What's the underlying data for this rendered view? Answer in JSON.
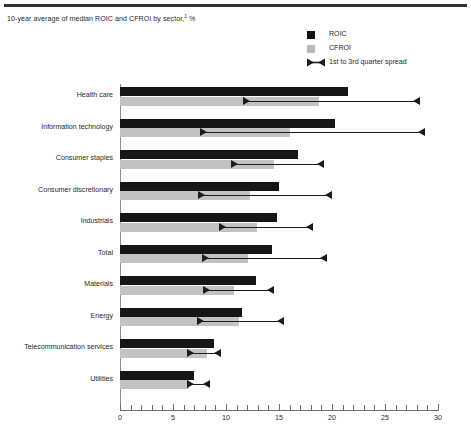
{
  "chart_title": "10-year average of median ROIC and CFROI by sector,",
  "chart_title_footnote": "1",
  "chart_title_unit": " %",
  "legend": {
    "items": [
      {
        "label": "ROIC",
        "icon": "filled-square-dark",
        "color": "#141414"
      },
      {
        "label": "CFROI",
        "icon": "filled-square-grey",
        "color": "#b9b9b9"
      },
      {
        "label": "1st to 3rd quarter spread",
        "icon": "spread-marker",
        "color": "#1c1c1c"
      }
    ]
  },
  "colors": {
    "roic": "#161616",
    "cfroi": "#c2c2c2",
    "spread": "#1c1c1c",
    "axis": "#6e6e6e",
    "text": "#2b2927",
    "top_rule": "#33302f"
  },
  "chart_data": {
    "type": "bar",
    "orientation": "horizontal",
    "title": "10-year average of median ROIC and CFROI by sector,1 %",
    "xlabel": "",
    "ylabel": "",
    "xlim": [
      0,
      30
    ],
    "xticks": [
      0,
      5,
      10,
      15,
      20,
      25,
      30
    ],
    "xtick_labels": [
      "0",
      "5",
      "10",
      "15",
      "20",
      "25",
      "30"
    ],
    "minor_tick_step": 1,
    "grid": false,
    "legend_position": "top-right",
    "categories": [
      "Health care",
      "Information technology",
      "Consumer staples",
      "Consumer discretionary",
      "Industrials",
      "Total",
      "Materials",
      "Energy",
      "Telecommunication services",
      "Utilities"
    ],
    "series": [
      {
        "name": "ROIC",
        "values": [
          21.5,
          20.3,
          16.8,
          15.0,
          14.8,
          14.3,
          12.8,
          11.5,
          8.9,
          7.0
        ]
      },
      {
        "name": "CFROI",
        "values": [
          18.8,
          16.0,
          14.5,
          12.3,
          12.9,
          12.1,
          10.8,
          11.2,
          8.2,
          6.5
        ]
      }
    ],
    "spread": {
      "name": "1st to 3rd quarter spread",
      "low": [
        11.6,
        7.5,
        10.5,
        7.4,
        9.3,
        7.7,
        7.8,
        7.3,
        6.3,
        6.3
      ],
      "high": [
        28.3,
        28.8,
        19.2,
        20.0,
        18.2,
        19.5,
        14.5,
        15.5,
        9.5,
        8.5
      ]
    }
  }
}
